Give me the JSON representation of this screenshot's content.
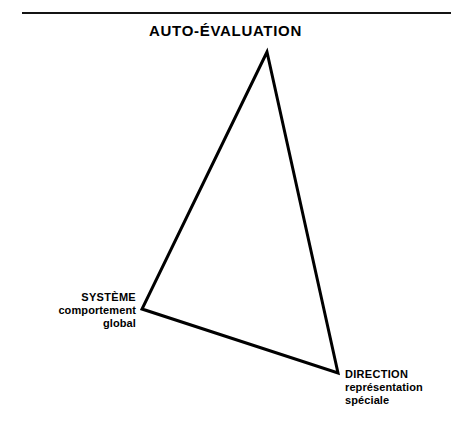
{
  "figure": {
    "title": "AUTO-ÉVALUATION",
    "stroke_color": "#000000",
    "rule_color": "#141414",
    "background_color": "#ffffff",
    "shape": "triangle",
    "vertices": [
      {
        "id": "apex",
        "x": 267,
        "y": 52,
        "label": "AUTO-ÉVALUATION"
      },
      {
        "id": "left",
        "x": 142,
        "y": 309,
        "label": "SYSTÈME"
      },
      {
        "id": "right",
        "x": 338,
        "y": 373,
        "label": "DIRECTION"
      }
    ],
    "labels": {
      "apex": {
        "title": "AUTO-ÉVALUATION",
        "sub1": "",
        "sub2": ""
      },
      "left": {
        "title": "SYSTÈME",
        "sub1": "comportement",
        "sub2": "global"
      },
      "right": {
        "title": "DIRECTION",
        "sub1": "représentation",
        "sub2": "spéciale"
      }
    }
  }
}
